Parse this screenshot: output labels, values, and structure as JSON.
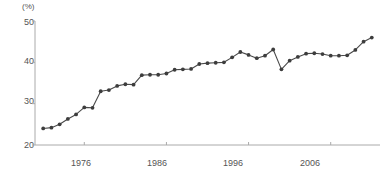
{
  "chart_data": {
    "type": "line",
    "title": "",
    "subtitle": "",
    "xlabel": "",
    "ylabel": "",
    "unit_label": "(%)",
    "xlim": [
      1970,
      2012
    ],
    "ylim": [
      20,
      50
    ],
    "yticks": [
      20,
      30,
      40,
      50
    ],
    "xticks": [
      1976,
      1986,
      1996,
      2006
    ],
    "grid": false,
    "legend": "none",
    "marker": "circle",
    "line_color": "#4a4a4a",
    "marker_color": "#3d3d3d",
    "axis_color": "#aaaaaa",
    "text_color": "#555555",
    "series": [
      {
        "name": "value",
        "x": [
          1971,
          1972,
          1973,
          1974,
          1975,
          1976,
          1977,
          1978,
          1979,
          1980,
          1981,
          1982,
          1983,
          1984,
          1985,
          1986,
          1987,
          1988,
          1989,
          1990,
          1991,
          1992,
          1993,
          1994,
          1995,
          1996,
          1997,
          1998,
          1999,
          2000,
          2001,
          2002,
          2003,
          2004,
          2005,
          2006,
          2007,
          2008,
          2009,
          2010,
          2011
        ],
        "values": [
          24.0,
          24.2,
          25.0,
          26.3,
          27.4,
          29.1,
          29.0,
          33.0,
          33.3,
          34.3,
          34.7,
          34.6,
          36.9,
          37.0,
          37.0,
          37.3,
          38.2,
          38.3,
          38.4,
          39.6,
          39.8,
          39.9,
          40.0,
          41.2,
          42.5,
          41.8,
          41.0,
          41.6,
          43.1,
          38.3,
          40.4,
          41.3,
          42.1,
          42.2,
          42.0,
          41.6,
          41.6,
          41.7,
          43.0,
          45.0,
          46.0
        ],
        "data_labels": []
      }
    ]
  },
  "axes": {
    "y_tick_labels": [
      "50",
      "40",
      "30",
      "20"
    ],
    "x_tick_labels": [
      "1976",
      "1986",
      "1996",
      "2006"
    ]
  }
}
